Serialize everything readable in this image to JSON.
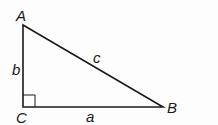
{
  "diagram": {
    "type": "right-triangle",
    "vertices": {
      "A": {
        "label": "A",
        "x": 23,
        "y": 25
      },
      "B": {
        "label": "B",
        "x": 163,
        "y": 107
      },
      "C": {
        "label": "C",
        "x": 23,
        "y": 107
      }
    },
    "sides": {
      "a": {
        "label": "a",
        "between": [
          "C",
          "B"
        ]
      },
      "b": {
        "label": "b",
        "between": [
          "A",
          "C"
        ]
      },
      "c": {
        "label": "c",
        "between": [
          "A",
          "B"
        ]
      }
    },
    "right_angle_at": "C",
    "colors": {
      "stroke": "#1a1a1a",
      "background": "#fdfdfd"
    }
  }
}
